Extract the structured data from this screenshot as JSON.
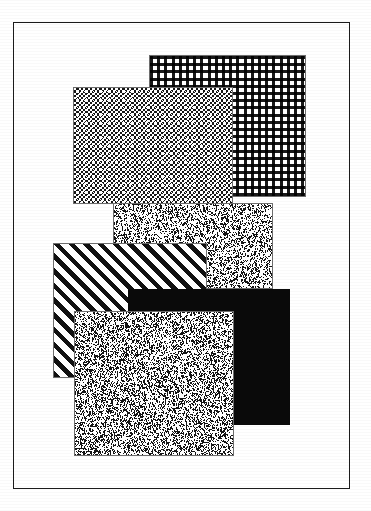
{
  "figure": {
    "canvas_width": 371,
    "canvas_height": 511,
    "background_color": "#ffffff",
    "ink_color": "#161616"
  },
  "frame": {
    "name": "page-border",
    "x": 13,
    "y": 22,
    "width": 337,
    "height": 467,
    "stroke_color": "#1b1b1b",
    "stroke_width": 1.5,
    "fill_color": "#ffffff"
  },
  "swatches": [
    {
      "id": "swatch-grid-dots",
      "label": "grid dot pattern",
      "pattern": "grid-dots",
      "z": 1,
      "x": 148,
      "y": 54,
      "width": 157,
      "height": 142,
      "ink_color": "#191919",
      "fill_color": "#ffffff",
      "density": "light",
      "cell_px": 7.2
    },
    {
      "id": "swatch-checker",
      "label": "dense checkerboard pattern",
      "pattern": "checkerboard",
      "z": 2,
      "x": 72,
      "y": 86,
      "width": 160,
      "height": 117,
      "ink_color": "#161616",
      "fill_color": "#ffffff",
      "density": "dark",
      "cell_px": 4.6
    },
    {
      "id": "swatch-speckle-upper",
      "label": "random speckle pattern",
      "pattern": "speckle",
      "z": 3,
      "x": 112,
      "y": 202,
      "width": 160,
      "height": 86,
      "ink_color": "#141414",
      "fill_color": "#ffffff",
      "density": "medium",
      "dot_density": 0.3,
      "seed": 1771
    },
    {
      "id": "swatch-diagonal",
      "label": "45 degree diagonal stripe pattern",
      "pattern": "diagonal-stripes",
      "z": 4,
      "x": 52,
      "y": 242,
      "width": 154,
      "height": 135,
      "ink_color": "#111111",
      "fill_color": "#ffffff",
      "density": "medium",
      "stripe_angle_deg": 45,
      "stripe_px": 4.6,
      "gap_px": 5.8
    },
    {
      "id": "swatch-solid-black",
      "label": "solid black fill",
      "pattern": "solid",
      "z": 5,
      "x": 127,
      "y": 288,
      "width": 162,
      "height": 136,
      "ink_color": "#0a0a0a",
      "fill_color": "#0a0a0a",
      "density": "opaque"
    },
    {
      "id": "swatch-speckle-lower",
      "label": "dense random speckle pattern",
      "pattern": "speckle",
      "z": 6,
      "x": 73,
      "y": 310,
      "width": 160,
      "height": 145,
      "ink_color": "#141414",
      "fill_color": "#ffffff",
      "density": "heavy",
      "dot_density": 0.34,
      "seed": 90210
    }
  ]
}
